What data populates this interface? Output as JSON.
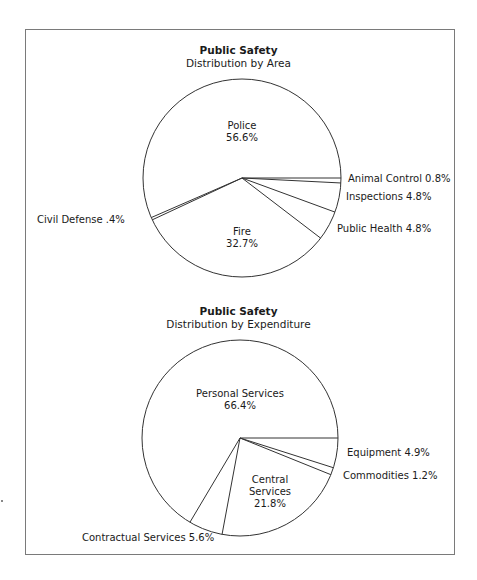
{
  "chart_data": [
    {
      "type": "pie",
      "title": "Public Safety",
      "subtitle": "Distribution by Area",
      "start_angle_deg": 0,
      "direction": "counterclockwise",
      "slices": [
        {
          "label": "Police",
          "value": 56.6,
          "display": "56.6%"
        },
        {
          "label": "Civil Defense",
          "value": 0.4,
          "display": ".4%"
        },
        {
          "label": "Fire",
          "value": 32.7,
          "display": "32.7%"
        },
        {
          "label": "Public Health",
          "value": 4.8,
          "display": "4.8%"
        },
        {
          "label": "Inspections",
          "value": 4.8,
          "display": "4.8%"
        },
        {
          "label": "Animal Control",
          "value": 0.8,
          "display": "0.8%"
        }
      ]
    },
    {
      "type": "pie",
      "title": "Public Safety",
      "subtitle": "Distribution by Expenditure",
      "start_angle_deg": 0,
      "direction": "counterclockwise",
      "slices": [
        {
          "label": "Personal Services",
          "value": 66.4,
          "display": "66.4%"
        },
        {
          "label": "Contractual Services",
          "value": 5.6,
          "display": "5.6%"
        },
        {
          "label": "Central Services",
          "value": 21.8,
          "display": "21.8%"
        },
        {
          "label": "Commodities",
          "value": 1.2,
          "display": "1.2%"
        },
        {
          "label": "Equipment",
          "value": 4.9,
          "display": "4.9%"
        }
      ]
    }
  ],
  "labels": {
    "area": {
      "title": "Public Safety",
      "subtitle": "Distribution by Area",
      "police_name": "Police",
      "police_pct": "56.6%",
      "fire_name": "Fire",
      "fire_pct": "32.7%",
      "civil_defense": "Civil Defense  .4%",
      "animal_control": "Animal Control  0.8%",
      "inspections": "Inspections 4.8%",
      "public_health": "Public Health 4.8%"
    },
    "expenditure": {
      "title": "Public Safety",
      "subtitle": "Distribution by Expenditure",
      "personal_name": "Personal Services",
      "personal_pct": "66.4%",
      "central_line1": "Central",
      "central_line2": "Services",
      "central_pct": "21.8%",
      "equipment": "Equipment 4.9%",
      "commodities": "Commodities 1.2%",
      "contractual": "Contractual Services 5.6%"
    }
  },
  "colors": {
    "line": "#333333",
    "frame": "#7a7a7a",
    "fill": "#ffffff"
  }
}
